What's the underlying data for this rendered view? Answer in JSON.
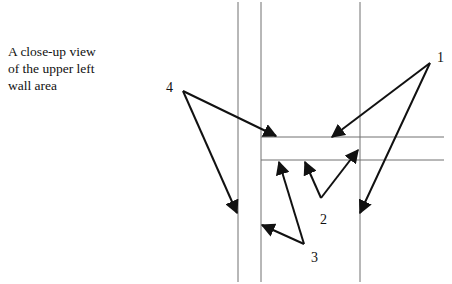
{
  "caption": {
    "line1": "A close-up view",
    "line2": "of the upper left",
    "line3": "wall area"
  },
  "colors": {
    "structure_line": "#707070",
    "arrow": "#111111",
    "background": "#ffffff"
  },
  "structure": {
    "vertical_lines_x": [
      238,
      261,
      360
    ],
    "horizontal_lines_y": [
      137,
      160
    ]
  },
  "callouts": [
    {
      "label": "1",
      "label_pos": [
        437,
        62
      ],
      "origin": [
        430,
        63
      ],
      "targets": [
        [
          332,
          137
        ],
        [
          360,
          213
        ]
      ]
    },
    {
      "label": "2",
      "label_pos": [
        320,
        224
      ],
      "origin": [
        321,
        198
      ],
      "targets": [
        [
          305,
          162
        ],
        [
          358,
          150
        ]
      ]
    },
    {
      "label": "3",
      "label_pos": [
        311,
        262
      ],
      "origin": [
        304,
        244
      ],
      "targets": [
        [
          279,
          162
        ],
        [
          262,
          225
        ]
      ]
    },
    {
      "label": "4",
      "label_pos": [
        166,
        92
      ],
      "origin": [
        183,
        91
      ],
      "targets": [
        [
          276,
          136
        ],
        [
          237,
          213
        ]
      ]
    }
  ]
}
